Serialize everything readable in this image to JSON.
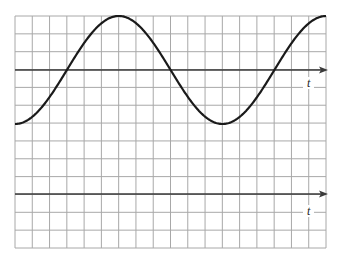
{
  "figure": {
    "grid": {
      "left": 15,
      "top": 16,
      "right": 326,
      "bottom": 248,
      "columns": 18,
      "rows": 13,
      "line_color": "#a8a8a8"
    },
    "axes": [
      {
        "id": "upper",
        "label": "t",
        "y": 70,
        "label_x": 303,
        "label_y": 77,
        "color": "#3a3a3a"
      },
      {
        "id": "lower",
        "label": "t",
        "y": 194,
        "label_x": 303,
        "label_y": 205,
        "color": "#3a3a3a"
      }
    ],
    "curve": {
      "type": "sinusoid",
      "axis": "upper",
      "start_x": 15,
      "end_x": 326,
      "center_y": 70,
      "amplitude_px": 54,
      "period_px": 207.5,
      "phase": "starts at minimum",
      "amplitude_grid_units": 3,
      "period_grid_units": 12,
      "color": "#1a1a1a"
    }
  }
}
